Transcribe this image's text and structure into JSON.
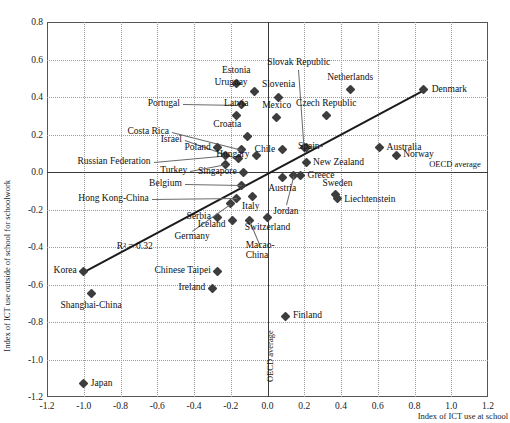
{
  "chart_data": {
    "type": "scatter",
    "title": "",
    "xlabel": "Index of ICT use at school",
    "ylabel": "Index of ICT use outside of school for schoolwork",
    "xlim": [
      -1.2,
      1.2
    ],
    "ylim": [
      -1.2,
      0.8
    ],
    "xticks": [
      "-1.2",
      "-1.0",
      "-0.8",
      "-0.6",
      "-0.4",
      "-0.2",
      "0.0",
      "0.2",
      "0.4",
      "0.6",
      "0.8",
      "1.0",
      "1.2"
    ],
    "yticks": [
      "0.8",
      "0.6",
      "0.4",
      "0.2",
      "0.0",
      "-0.2",
      "-0.4",
      "-0.6",
      "-0.8",
      "-1.0",
      "-1.2"
    ],
    "grid": true,
    "legend": "none",
    "annotations": {
      "r_squared": "R² = 0.32",
      "oecd_average_horizontal": "OECD average",
      "oecd_average_vertical": "OECD average"
    },
    "trendline": {
      "x0": -1.0,
      "y0": -0.53,
      "x1": 0.85,
      "y1": 0.44
    },
    "points": [
      {
        "name": "Estonia",
        "x": -0.17,
        "y": 0.47,
        "pos": "above"
      },
      {
        "name": "Uruguay",
        "x": -0.07,
        "y": 0.43,
        "pos": "left"
      },
      {
        "name": "Portugal",
        "x": -0.14,
        "y": 0.36,
        "pos": "leader-left"
      },
      {
        "name": "Slovenia",
        "x": 0.06,
        "y": 0.4,
        "pos": "above"
      },
      {
        "name": "Netherlands",
        "x": 0.45,
        "y": 0.44,
        "pos": "above"
      },
      {
        "name": "Denmark",
        "x": 0.85,
        "y": 0.44,
        "pos": "right"
      },
      {
        "name": "Latvia",
        "x": -0.17,
        "y": 0.3,
        "pos": "above"
      },
      {
        "name": "Mexico",
        "x": 0.05,
        "y": 0.29,
        "pos": "above"
      },
      {
        "name": "Czech Republic",
        "x": 0.32,
        "y": 0.3,
        "pos": "above"
      },
      {
        "name": "Croatia",
        "x": -0.11,
        "y": 0.19,
        "pos": "above"
      },
      {
        "name": "Costa Rica",
        "x": -0.14,
        "y": 0.12,
        "pos": "leader-left"
      },
      {
        "name": "Israel",
        "x": -0.16,
        "y": 0.07,
        "pos": "leader-left"
      },
      {
        "name": "Spain",
        "x": 0.21,
        "y": 0.13,
        "pos": "leader-right"
      },
      {
        "name": "Australia",
        "x": 0.61,
        "y": 0.13,
        "pos": "right"
      },
      {
        "name": "Norway",
        "x": 0.7,
        "y": 0.09,
        "pos": "right"
      },
      {
        "name": "Chile",
        "x": 0.08,
        "y": 0.12,
        "pos": "left"
      },
      {
        "name": "Hungary",
        "x": -0.06,
        "y": 0.09,
        "pos": "left"
      },
      {
        "name": "Poland",
        "x": -0.27,
        "y": 0.13,
        "pos": "left"
      },
      {
        "name": "Russian Federation",
        "x": -0.23,
        "y": 0.09,
        "pos": "leader-left"
      },
      {
        "name": "Turkey",
        "x": -0.23,
        "y": 0.04,
        "pos": "leader-left"
      },
      {
        "name": "Slovak Republic",
        "x": 0.2,
        "y": 0.13,
        "pos": "leader-up"
      },
      {
        "name": "New Zealand",
        "x": 0.21,
        "y": 0.05,
        "pos": "right"
      },
      {
        "name": "Singapore",
        "x": -0.13,
        "y": 0.0,
        "pos": "left"
      },
      {
        "name": "Greece",
        "x": 0.18,
        "y": -0.02,
        "pos": "right"
      },
      {
        "name": "Jordan",
        "x": 0.14,
        "y": -0.02,
        "pos": "leader-down"
      },
      {
        "name": "Austria",
        "x": 0.08,
        "y": -0.03,
        "pos": "below"
      },
      {
        "name": "Belgium",
        "x": -0.14,
        "y": -0.07,
        "pos": "leader-left"
      },
      {
        "name": "Italy",
        "x": -0.08,
        "y": -0.13,
        "pos": "below"
      },
      {
        "name": "Hong Kong-China",
        "x": -0.17,
        "y": -0.14,
        "pos": "leader-left"
      },
      {
        "name": "Sweden",
        "x": 0.37,
        "y": -0.12,
        "pos": "above"
      },
      {
        "name": "Liechtenstein",
        "x": 0.38,
        "y": -0.14,
        "pos": "right"
      },
      {
        "name": "Serbia",
        "x": -0.27,
        "y": -0.24,
        "pos": "left"
      },
      {
        "name": "Iceland",
        "x": -0.19,
        "y": -0.26,
        "pos": "left"
      },
      {
        "name": "Germany",
        "x": -0.2,
        "y": -0.17,
        "pos": "leader-down"
      },
      {
        "name": "Switzerland",
        "x": 0.0,
        "y": -0.24,
        "pos": "below"
      },
      {
        "name": "Macao-China",
        "x": -0.1,
        "y": -0.26,
        "pos": "leader-down"
      },
      {
        "name": "Korea",
        "x": -1.0,
        "y": -0.53,
        "pos": "left"
      },
      {
        "name": "Chinese Taipei",
        "x": -0.27,
        "y": -0.53,
        "pos": "left"
      },
      {
        "name": "Ireland",
        "x": -0.3,
        "y": -0.62,
        "pos": "left"
      },
      {
        "name": "Shanghai-China",
        "x": -0.96,
        "y": -0.65,
        "pos": "below"
      },
      {
        "name": "Finland",
        "x": 0.1,
        "y": -0.77,
        "pos": "right"
      },
      {
        "name": "Japan",
        "x": -1.0,
        "y": -1.13,
        "pos": "right"
      }
    ]
  }
}
